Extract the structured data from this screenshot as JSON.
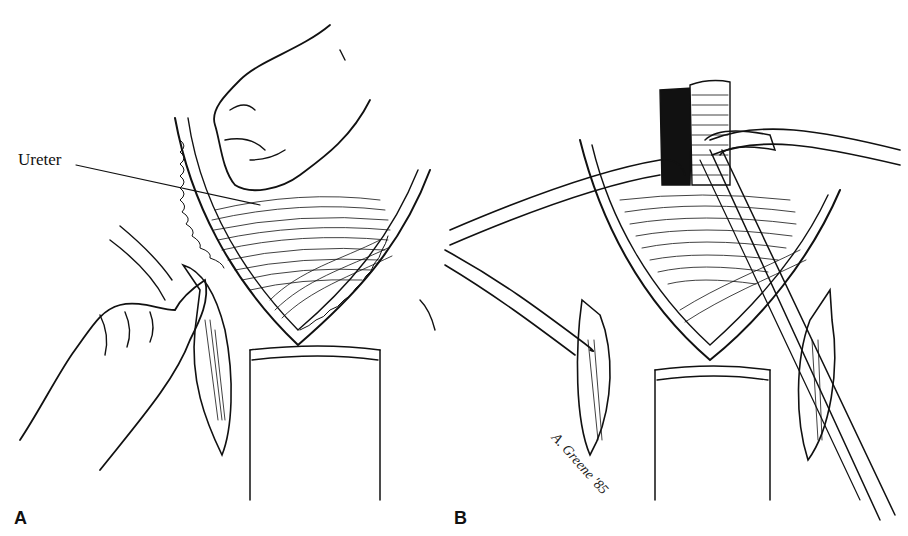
{
  "figure": {
    "panels": [
      {
        "id": "A",
        "label": "A",
        "annotations": [
          {
            "text": "Ureter"
          }
        ]
      },
      {
        "id": "B",
        "label": "B"
      }
    ],
    "signature": "A. Greene '85",
    "colors": {
      "ink": "#111111",
      "background": "#ffffff"
    }
  }
}
